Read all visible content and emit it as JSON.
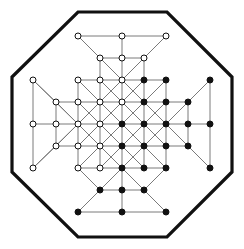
{
  "figure": {
    "width": 244,
    "height": 249
  },
  "style": {
    "background": "#ffffff",
    "border_color": "#111111",
    "border_width": 3.2,
    "edge_color": "#7a7a7a",
    "edge_width": 1.0,
    "node_radius": 3.0,
    "node_fill_open": "#ffffff",
    "node_fill_closed": "#111111",
    "node_stroke": "#111111",
    "node_stroke_width": 1.0
  },
  "octagon": {
    "name": "octagon-border",
    "points": [
      [
        78,
        12
      ],
      [
        167,
        12
      ],
      [
        232,
        77
      ],
      [
        232,
        172
      ],
      [
        167,
        237
      ],
      [
        78,
        237
      ],
      [
        12,
        172
      ],
      [
        12,
        77
      ]
    ]
  },
  "lattice": {
    "center": [
      122,
      124
    ],
    "spacing": 22,
    "columns": [
      33,
      56,
      78,
      100,
      122,
      144,
      166,
      188,
      210
    ],
    "rows": [
      36,
      58,
      80,
      102,
      124,
      146,
      168,
      190,
      212
    ],
    "nodes": [
      {
        "id": "t1",
        "x": 78,
        "y": 36,
        "fill": "open"
      },
      {
        "id": "t2",
        "x": 122,
        "y": 36,
        "fill": "open"
      },
      {
        "id": "t3",
        "x": 166,
        "y": 36,
        "fill": "open"
      },
      {
        "id": "t4",
        "x": 100,
        "y": 58,
        "fill": "open"
      },
      {
        "id": "t5",
        "x": 122,
        "y": 58,
        "fill": "open"
      },
      {
        "id": "t6",
        "x": 144,
        "y": 58,
        "fill": "open"
      },
      {
        "id": "g00",
        "x": 78,
        "y": 80,
        "fill": "open"
      },
      {
        "id": "g10",
        "x": 100,
        "y": 80,
        "fill": "open"
      },
      {
        "id": "g20",
        "x": 122,
        "y": 80,
        "fill": "open"
      },
      {
        "id": "g30",
        "x": 144,
        "y": 80,
        "fill": "closed"
      },
      {
        "id": "g40",
        "x": 166,
        "y": 80,
        "fill": "closed"
      },
      {
        "id": "g01",
        "x": 78,
        "y": 102,
        "fill": "open"
      },
      {
        "id": "g11",
        "x": 100,
        "y": 102,
        "fill": "open"
      },
      {
        "id": "g21",
        "x": 122,
        "y": 102,
        "fill": "open"
      },
      {
        "id": "g31",
        "x": 144,
        "y": 102,
        "fill": "closed"
      },
      {
        "id": "g41",
        "x": 166,
        "y": 102,
        "fill": "closed"
      },
      {
        "id": "g02",
        "x": 78,
        "y": 124,
        "fill": "open"
      },
      {
        "id": "g12",
        "x": 100,
        "y": 124,
        "fill": "open"
      },
      {
        "id": "g22",
        "x": 122,
        "y": 124,
        "fill": "closed"
      },
      {
        "id": "g32",
        "x": 144,
        "y": 124,
        "fill": "closed"
      },
      {
        "id": "g42",
        "x": 166,
        "y": 124,
        "fill": "closed"
      },
      {
        "id": "g03",
        "x": 78,
        "y": 146,
        "fill": "open"
      },
      {
        "id": "g13",
        "x": 100,
        "y": 146,
        "fill": "open"
      },
      {
        "id": "g23",
        "x": 122,
        "y": 146,
        "fill": "closed"
      },
      {
        "id": "g33",
        "x": 144,
        "y": 146,
        "fill": "closed"
      },
      {
        "id": "g43",
        "x": 166,
        "y": 146,
        "fill": "closed"
      },
      {
        "id": "g04",
        "x": 78,
        "y": 168,
        "fill": "open"
      },
      {
        "id": "g14",
        "x": 100,
        "y": 168,
        "fill": "open"
      },
      {
        "id": "g24",
        "x": 122,
        "y": 168,
        "fill": "closed"
      },
      {
        "id": "g34",
        "x": 144,
        "y": 168,
        "fill": "closed"
      },
      {
        "id": "g44",
        "x": 166,
        "y": 168,
        "fill": "closed"
      },
      {
        "id": "b1",
        "x": 100,
        "y": 190,
        "fill": "closed"
      },
      {
        "id": "b2",
        "x": 122,
        "y": 190,
        "fill": "closed"
      },
      {
        "id": "b3",
        "x": 144,
        "y": 190,
        "fill": "closed"
      },
      {
        "id": "b4",
        "x": 78,
        "y": 212,
        "fill": "closed"
      },
      {
        "id": "b5",
        "x": 122,
        "y": 212,
        "fill": "closed"
      },
      {
        "id": "b6",
        "x": 166,
        "y": 212,
        "fill": "closed"
      },
      {
        "id": "l1",
        "x": 33,
        "y": 80,
        "fill": "open"
      },
      {
        "id": "l2",
        "x": 33,
        "y": 124,
        "fill": "open"
      },
      {
        "id": "l3",
        "x": 33,
        "y": 168,
        "fill": "open"
      },
      {
        "id": "l4",
        "x": 56,
        "y": 102,
        "fill": "open"
      },
      {
        "id": "l5",
        "x": 56,
        "y": 124,
        "fill": "open"
      },
      {
        "id": "l6",
        "x": 56,
        "y": 146,
        "fill": "open"
      },
      {
        "id": "r1",
        "x": 210,
        "y": 80,
        "fill": "closed"
      },
      {
        "id": "r2",
        "x": 210,
        "y": 124,
        "fill": "closed"
      },
      {
        "id": "r3",
        "x": 210,
        "y": 168,
        "fill": "closed"
      },
      {
        "id": "r4",
        "x": 188,
        "y": 102,
        "fill": "closed"
      },
      {
        "id": "r5",
        "x": 188,
        "y": 124,
        "fill": "closed"
      },
      {
        "id": "r6",
        "x": 188,
        "y": 146,
        "fill": "closed"
      }
    ],
    "edges": [
      [
        "t1",
        "t2"
      ],
      [
        "t2",
        "t3"
      ],
      [
        "t4",
        "t5"
      ],
      [
        "t5",
        "t6"
      ],
      [
        "t1",
        "t4"
      ],
      [
        "t4",
        "g10"
      ],
      [
        "t3",
        "t6"
      ],
      [
        "t6",
        "g30"
      ],
      [
        "t2",
        "t5"
      ],
      [
        "t5",
        "g20"
      ],
      [
        "t1",
        "g20"
      ],
      [
        "t3",
        "g20"
      ],
      [
        "t4",
        "g20"
      ],
      [
        "t6",
        "g20"
      ],
      [
        "g00",
        "g10"
      ],
      [
        "g10",
        "g20"
      ],
      [
        "g20",
        "g30"
      ],
      [
        "g30",
        "g40"
      ],
      [
        "g01",
        "g11"
      ],
      [
        "g11",
        "g21"
      ],
      [
        "g21",
        "g31"
      ],
      [
        "g31",
        "g41"
      ],
      [
        "g02",
        "g12"
      ],
      [
        "g12",
        "g22"
      ],
      [
        "g22",
        "g32"
      ],
      [
        "g32",
        "g42"
      ],
      [
        "g03",
        "g13"
      ],
      [
        "g13",
        "g23"
      ],
      [
        "g23",
        "g33"
      ],
      [
        "g33",
        "g43"
      ],
      [
        "g04",
        "g14"
      ],
      [
        "g14",
        "g24"
      ],
      [
        "g24",
        "g34"
      ],
      [
        "g34",
        "g44"
      ],
      [
        "g00",
        "g01"
      ],
      [
        "g01",
        "g02"
      ],
      [
        "g02",
        "g03"
      ],
      [
        "g03",
        "g04"
      ],
      [
        "g10",
        "g11"
      ],
      [
        "g11",
        "g12"
      ],
      [
        "g12",
        "g13"
      ],
      [
        "g13",
        "g14"
      ],
      [
        "g20",
        "g21"
      ],
      [
        "g21",
        "g22"
      ],
      [
        "g22",
        "g23"
      ],
      [
        "g23",
        "g24"
      ],
      [
        "g30",
        "g31"
      ],
      [
        "g31",
        "g32"
      ],
      [
        "g32",
        "g33"
      ],
      [
        "g33",
        "g34"
      ],
      [
        "g40",
        "g41"
      ],
      [
        "g41",
        "g42"
      ],
      [
        "g42",
        "g43"
      ],
      [
        "g43",
        "g44"
      ],
      [
        "g00",
        "g11"
      ],
      [
        "g11",
        "g22"
      ],
      [
        "g22",
        "g33"
      ],
      [
        "g33",
        "g44"
      ],
      [
        "g10",
        "g21"
      ],
      [
        "g21",
        "g32"
      ],
      [
        "g32",
        "g43"
      ],
      [
        "g20",
        "g31"
      ],
      [
        "g31",
        "g42"
      ],
      [
        "g01",
        "g12"
      ],
      [
        "g12",
        "g23"
      ],
      [
        "g23",
        "g34"
      ],
      [
        "g02",
        "g13"
      ],
      [
        "g13",
        "g24"
      ],
      [
        "g40",
        "g31"
      ],
      [
        "g31",
        "g22"
      ],
      [
        "g22",
        "g13"
      ],
      [
        "g13",
        "g04"
      ],
      [
        "g30",
        "g21"
      ],
      [
        "g21",
        "g12"
      ],
      [
        "g12",
        "g03"
      ],
      [
        "g20",
        "g11"
      ],
      [
        "g11",
        "g02"
      ],
      [
        "g41",
        "g32"
      ],
      [
        "g32",
        "g23"
      ],
      [
        "g23",
        "g14"
      ],
      [
        "g42",
        "g33"
      ],
      [
        "g33",
        "g24"
      ],
      [
        "g04",
        "b1"
      ],
      [
        "b1",
        "b2"
      ],
      [
        "b2",
        "b3"
      ],
      [
        "g44",
        "b3"
      ],
      [
        "b4",
        "b5"
      ],
      [
        "b5",
        "b6"
      ],
      [
        "b1",
        "b4"
      ],
      [
        "b3",
        "b6"
      ],
      [
        "b2",
        "b5"
      ],
      [
        "g24",
        "b1"
      ],
      [
        "g24",
        "b3"
      ],
      [
        "g24",
        "b4"
      ],
      [
        "g24",
        "b6"
      ],
      [
        "g24",
        "b2"
      ],
      [
        "l1",
        "l2"
      ],
      [
        "l2",
        "l3"
      ],
      [
        "l4",
        "l5"
      ],
      [
        "l5",
        "l6"
      ],
      [
        "l1",
        "l4"
      ],
      [
        "l4",
        "g01"
      ],
      [
        "l3",
        "l6"
      ],
      [
        "l6",
        "g03"
      ],
      [
        "l2",
        "l5"
      ],
      [
        "l5",
        "g02"
      ],
      [
        "l1",
        "g02"
      ],
      [
        "l3",
        "g02"
      ],
      [
        "l4",
        "g02"
      ],
      [
        "l6",
        "g02"
      ],
      [
        "r1",
        "r2"
      ],
      [
        "r2",
        "r3"
      ],
      [
        "r4",
        "r5"
      ],
      [
        "r5",
        "r6"
      ],
      [
        "r1",
        "r4"
      ],
      [
        "r4",
        "g41"
      ],
      [
        "r3",
        "r6"
      ],
      [
        "r6",
        "g43"
      ],
      [
        "r2",
        "r5"
      ],
      [
        "r5",
        "g42"
      ],
      [
        "r1",
        "g42"
      ],
      [
        "r3",
        "g42"
      ],
      [
        "r4",
        "g42"
      ],
      [
        "r6",
        "g42"
      ]
    ]
  }
}
